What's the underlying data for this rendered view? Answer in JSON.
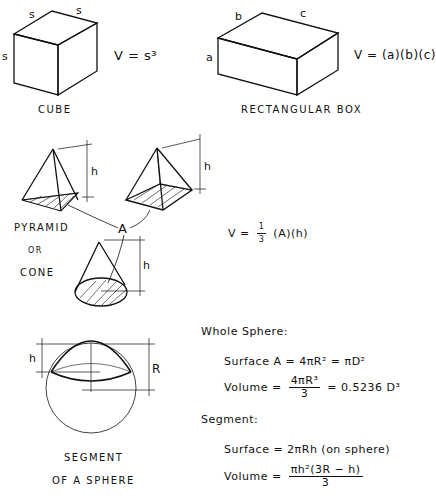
{
  "cube": {
    "caption": "Cube",
    "edge_labels": [
      "s",
      "s",
      "s"
    ],
    "formula": "V = s³"
  },
  "box": {
    "caption": "Rectangular Box",
    "edge_labels": {
      "a": "a",
      "b": "b",
      "c": "c"
    },
    "formula": "V = (a)(b)(c)"
  },
  "pyramid_cone": {
    "caption_line1": "Pyramid",
    "caption_line2": "or",
    "caption_line3": "Cone",
    "height_label": "h",
    "area_label": "A",
    "formula_prefix": "V =",
    "formula_frac_num": "1",
    "formula_frac_den": "3",
    "formula_suffix": "(A)(h)"
  },
  "sphere": {
    "caption_line1": "Segment",
    "caption_line2": "of a Sphere",
    "h_label": "h",
    "r_label": "R",
    "whole_heading": "Whole Sphere:",
    "whole_surface": "Surface  A = 4πR² = πD²",
    "whole_volume_prefix": "Volume  =",
    "whole_volume_num": "4πR³",
    "whole_volume_den": "3",
    "whole_volume_suffix": "= 0.5236 D³",
    "segment_heading": "Segment:",
    "segment_surface": "Surface = 2πRh   (on sphere)",
    "segment_volume_prefix": "Volume  =",
    "segment_volume_num": "πh²(3R − h)",
    "segment_volume_den": "3"
  }
}
